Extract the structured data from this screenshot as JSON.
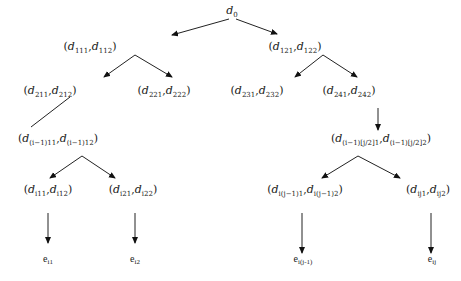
{
  "diagram": {
    "title": "",
    "nodes": [
      {
        "id": "root",
        "label": "d",
        "sub": "0",
        "x": 232,
        "y": 4,
        "paren": false
      },
      {
        "id": "n111",
        "pairs": [
          [
            "d",
            "111"
          ],
          [
            "d",
            "112"
          ]
        ],
        "x": 90,
        "y": 40
      },
      {
        "id": "n121",
        "pairs": [
          [
            "d",
            "121"
          ],
          [
            "d",
            "122"
          ]
        ],
        "x": 295,
        "y": 40
      },
      {
        "id": "n211",
        "pairs": [
          [
            "d",
            "211"
          ],
          [
            "d",
            "212"
          ]
        ],
        "x": 50,
        "y": 84
      },
      {
        "id": "n221",
        "pairs": [
          [
            "d",
            "221"
          ],
          [
            "d",
            "222"
          ]
        ],
        "x": 164,
        "y": 84
      },
      {
        "id": "n231",
        "pairs": [
          [
            "d",
            "231"
          ],
          [
            "d",
            "232"
          ]
        ],
        "x": 257,
        "y": 84
      },
      {
        "id": "n241",
        "pairs": [
          [
            "d",
            "241"
          ],
          [
            "d",
            "242"
          ]
        ],
        "x": 349,
        "y": 84
      },
      {
        "id": "ni111",
        "pairs": [
          [
            "d",
            "(i−1)11"
          ],
          [
            "d",
            "(i−1)12"
          ]
        ],
        "x": 58,
        "y": 132
      },
      {
        "id": "nij21",
        "pairs": [
          [
            "d",
            "(i−1)[j/2]1"
          ],
          [
            "d",
            "(i−1)[j/2]2"
          ]
        ],
        "x": 381,
        "y": 132
      },
      {
        "id": "ni11",
        "pairs": [
          [
            "d",
            "i11"
          ],
          [
            "d",
            "i12"
          ]
        ],
        "x": 48,
        "y": 183
      },
      {
        "id": "ni21",
        "pairs": [
          [
            "d",
            "i21"
          ],
          [
            "d",
            "i22"
          ]
        ],
        "x": 133,
        "y": 183
      },
      {
        "id": "nij11",
        "pairs": [
          [
            "d",
            "i(j−1)1"
          ],
          [
            "d",
            "i(j−1)2"
          ]
        ],
        "x": 305,
        "y": 183
      },
      {
        "id": "nij1",
        "pairs": [
          [
            "d",
            "ij1"
          ],
          [
            "d",
            "ij2"
          ]
        ],
        "x": 428,
        "y": 183
      }
    ],
    "leaves": [
      {
        "id": "ei1",
        "label": "e",
        "sub": "i1",
        "x": 48,
        "y": 253
      },
      {
        "id": "ei2",
        "label": "e",
        "sub": "i2",
        "x": 135,
        "y": 253
      },
      {
        "id": "eij1",
        "label": "e",
        "sub": "i(j-1)",
        "x": 303,
        "y": 253
      },
      {
        "id": "eij",
        "label": "e",
        "sub": "ij",
        "x": 432,
        "y": 253
      }
    ],
    "edges": [
      {
        "x1": 229,
        "y1": 19,
        "x2": 172,
        "y2": 35,
        "arrow": true
      },
      {
        "x1": 236,
        "y1": 19,
        "x2": 277,
        "y2": 34,
        "arrow": true
      },
      {
        "x1": 135,
        "y1": 55,
        "x2": 104,
        "y2": 77,
        "arrow": true
      },
      {
        "x1": 135,
        "y1": 55,
        "x2": 172,
        "y2": 77,
        "arrow": true
      },
      {
        "x1": 323,
        "y1": 55,
        "x2": 295,
        "y2": 77,
        "arrow": true
      },
      {
        "x1": 323,
        "y1": 55,
        "x2": 357,
        "y2": 77,
        "arrow": true
      },
      {
        "x1": 70,
        "y1": 97,
        "x2": 31,
        "y2": 127,
        "arrow": false
      },
      {
        "x1": 378,
        "y1": 108,
        "x2": 378,
        "y2": 130,
        "arrow": true
      },
      {
        "x1": 82,
        "y1": 156,
        "x2": 50,
        "y2": 178,
        "arrow": true
      },
      {
        "x1": 82,
        "y1": 156,
        "x2": 115,
        "y2": 178,
        "arrow": true
      },
      {
        "x1": 358,
        "y1": 156,
        "x2": 322,
        "y2": 178,
        "arrow": true
      },
      {
        "x1": 358,
        "y1": 156,
        "x2": 400,
        "y2": 178,
        "arrow": true
      },
      {
        "x1": 48,
        "y1": 213,
        "x2": 48,
        "y2": 243,
        "arrow": true
      },
      {
        "x1": 135,
        "y1": 213,
        "x2": 135,
        "y2": 243,
        "arrow": true
      },
      {
        "x1": 302,
        "y1": 213,
        "x2": 302,
        "y2": 253,
        "arrow": true
      },
      {
        "x1": 431,
        "y1": 213,
        "x2": 431,
        "y2": 253,
        "arrow": true
      }
    ],
    "colors": {
      "line": "#222222",
      "text": "#1a1a1a",
      "background": "#ffffff"
    }
  }
}
